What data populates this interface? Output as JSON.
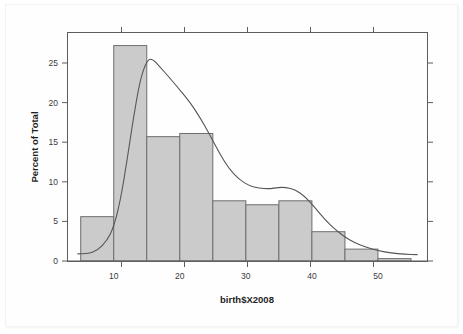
{
  "chart_data": {
    "type": "bar",
    "title": "",
    "subtitle": "",
    "xlabel": "birth$X2008",
    "ylabel": "Percent of Total",
    "xlim": [
      3.0,
      57.5
    ],
    "ylim": [
      -1.2,
      28.6
    ],
    "grid": false,
    "legend": null,
    "bin_width": 5,
    "bin_edges": [
      5,
      10,
      15,
      20,
      25,
      30,
      35,
      40,
      45,
      50,
      55
    ],
    "categories": [
      "5-10",
      "10-15",
      "15-20",
      "20-25",
      "25-30",
      "30-35",
      "35-40",
      "40-45",
      "45-50",
      "50-55"
    ],
    "values": [
      5.6,
      27.2,
      15.7,
      16.1,
      7.6,
      7.1,
      7.6,
      3.7,
      1.5,
      0.3
    ],
    "xticks": [
      10,
      20,
      30,
      40,
      50
    ],
    "xtick_labels": [
      "10",
      "20",
      "30",
      "40",
      "50"
    ],
    "yticks": [
      0,
      5,
      10,
      15,
      20,
      25
    ],
    "ytick_labels": [
      "0",
      "5",
      "10",
      "15",
      "20",
      "25"
    ],
    "series": [
      {
        "name": "histogram",
        "kind": "bar",
        "values": [
          5.6,
          27.2,
          15.7,
          16.1,
          7.6,
          7.1,
          7.6,
          3.7,
          1.5,
          0.3
        ]
      },
      {
        "name": "density",
        "kind": "line",
        "x": [
          4.5,
          6.0,
          7.5,
          9.0,
          10.0,
          11.0,
          12.0,
          13.0,
          14.0,
          15.0,
          15.8,
          17.0,
          18.5,
          20.0,
          21.5,
          23.0,
          24.5,
          26.0,
          27.5,
          29.0,
          30.5,
          32.0,
          33.5,
          35.0,
          36.0,
          37.5,
          39.0,
          40.5,
          42.0,
          43.5,
          45.0,
          46.5,
          48.0,
          50.0,
          52.0,
          54.0,
          56.0
        ],
        "y": [
          0.9,
          0.9,
          1.3,
          2.6,
          4.3,
          7.6,
          12.6,
          18.2,
          22.9,
          25.3,
          25.6,
          24.5,
          23.1,
          21.6,
          20.1,
          18.2,
          16.0,
          13.6,
          11.6,
          10.3,
          9.5,
          9.2,
          9.1,
          9.3,
          9.3,
          9.0,
          8.1,
          6.7,
          5.2,
          4.0,
          3.0,
          2.3,
          1.8,
          1.3,
          1.0,
          0.85,
          0.8
        ]
      }
    ],
    "colors": {
      "bar_fill": "#cbcbcb",
      "bar_stroke": "#6e6e6e",
      "density_line": "#555555",
      "axis": "#5d5d5d",
      "text": "#3a3a3a",
      "background": "#ffffff"
    }
  }
}
